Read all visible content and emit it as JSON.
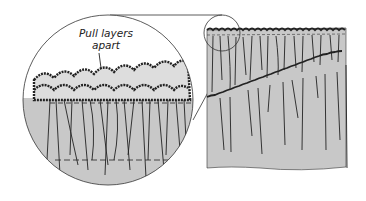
{
  "diagram": {
    "annotation": {
      "line1": "Pull layers",
      "line2": "apart"
    },
    "colors": {
      "fabric": "#c8c8c8",
      "ink": "#222222",
      "background": "#ffffff"
    }
  }
}
